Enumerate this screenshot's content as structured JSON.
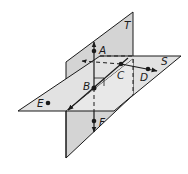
{
  "diagram": {
    "planes": [
      {
        "name": "T",
        "label": "T",
        "orientation": "vertical"
      },
      {
        "name": "S",
        "label": "S",
        "orientation": "horizontal"
      }
    ],
    "points": [
      {
        "name": "A",
        "label": "A"
      },
      {
        "name": "B",
        "label": "B"
      },
      {
        "name": "C",
        "label": "C"
      },
      {
        "name": "D",
        "label": "D"
      },
      {
        "name": "E",
        "label": "E"
      },
      {
        "name": "F",
        "label": "F"
      }
    ],
    "features": {
      "right_angle_marker_at": "B",
      "line_of_intersection": "BC",
      "ray_AF_through": "B",
      "ray_CD": "on plane S"
    },
    "colors": {
      "plane_fill": "#d9d9d9",
      "plane_overlap_fill": "#e8e8e8",
      "stroke": "#1a1a1a"
    }
  }
}
